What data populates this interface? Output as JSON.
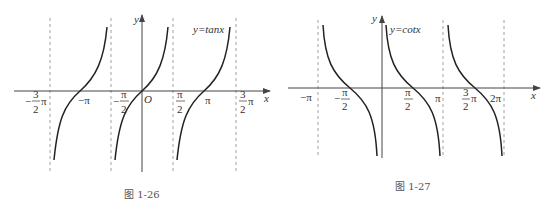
{
  "figures": [
    {
      "id": "tan",
      "caption": "图 1-26",
      "function_label": "y=tanx",
      "axis_x": "x",
      "axis_y": "y",
      "origin": "O",
      "tick_labels": {
        "neg_three_half_pi": {
          "num": "3",
          "den": "2",
          "prefix": "−",
          "suffix": "π"
        },
        "neg_pi": "−π",
        "neg_half_pi": {
          "num": "π",
          "den": "2",
          "prefix": "−"
        },
        "half_pi": {
          "num": "π",
          "den": "2"
        },
        "pi": "π",
        "three_half_pi": {
          "num": "3",
          "den": "2",
          "suffix": "π"
        }
      },
      "asymptotes": [
        "-3π/2",
        "-π/2",
        "π/2",
        "3π/2"
      ]
    },
    {
      "id": "cot",
      "caption": "图 1-27",
      "function_label": "y=cotx",
      "axis_x": "x",
      "axis_y": "y",
      "tick_labels": {
        "neg_pi": "−π",
        "neg_half_pi": {
          "num": "π",
          "den": "2",
          "prefix": "−"
        },
        "half_pi": {
          "num": "π",
          "den": "2"
        },
        "pi": "π",
        "three_half_pi": {
          "num": "3",
          "den": "2",
          "suffix": "π"
        },
        "two_pi": "2π"
      },
      "asymptotes": [
        "-π",
        "0",
        "π",
        "2π"
      ]
    }
  ],
  "colors": {
    "curve": "#222222",
    "axis": "#444444",
    "dash": "#888888"
  }
}
